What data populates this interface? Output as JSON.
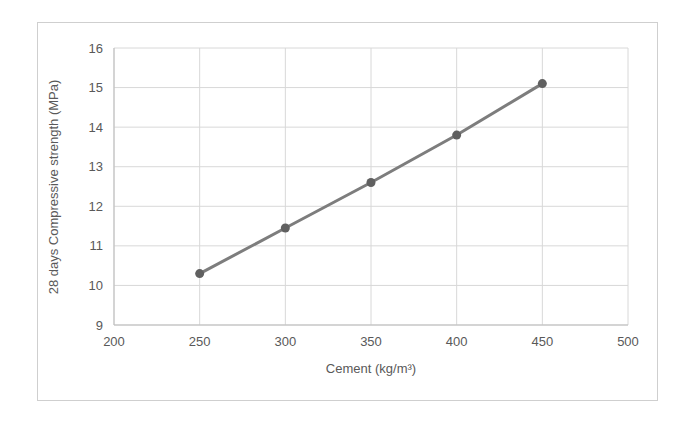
{
  "page": {
    "background_color": "#ffffff",
    "frame_border_color": "#cfcfcf"
  },
  "chart_data": {
    "type": "line",
    "title": "",
    "xlabel": "Cement (kg/m³)",
    "ylabel": "28 days Compressive strength (MPa)",
    "x": [
      250,
      300,
      350,
      400,
      450
    ],
    "series": [
      {
        "name": "28 days Compressive strength",
        "values": [
          10.3,
          11.45,
          12.6,
          13.8,
          15.1
        ]
      }
    ],
    "xlim": [
      200,
      500
    ],
    "ylim": [
      9,
      16
    ],
    "x_ticks": [
      200,
      250,
      300,
      350,
      400,
      450,
      500
    ],
    "y_ticks": [
      9,
      10,
      11,
      12,
      13,
      14,
      15,
      16
    ],
    "grid": true,
    "legend": "none",
    "line_color": "#7d7d7d",
    "marker_color": "#606060",
    "gridline_color": "#d8d8d8",
    "axis_line_color": "#bdbdbd",
    "axis_text_color": "#595959"
  }
}
